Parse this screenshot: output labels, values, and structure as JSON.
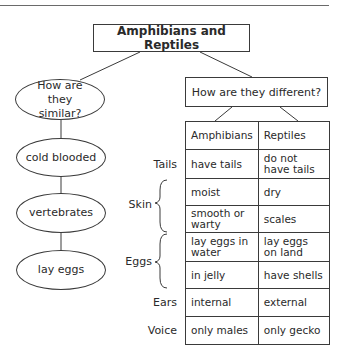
{
  "title": "Amphibians and Reptiles",
  "similar": {
    "question": "How are they similar?",
    "items": [
      "cold blooded",
      "vertebrates",
      "lay eggs"
    ]
  },
  "different": {
    "question": "How are they different?",
    "table": {
      "headers": [
        "Amphibians",
        "Reptiles"
      ],
      "groups": [
        {
          "label": "Tails",
          "rows": [
            [
              "have tails",
              "do not have tails"
            ]
          ]
        },
        {
          "label": "Skin",
          "rows": [
            [
              "moist",
              "dry"
            ],
            [
              "smooth or warty",
              "scales"
            ]
          ]
        },
        {
          "label": "Eggs",
          "rows": [
            [
              "lay eggs in water",
              "lay eggs on land"
            ],
            [
              "in jelly",
              "have shells"
            ]
          ]
        },
        {
          "label": "Ears",
          "rows": [
            [
              "internal",
              "external"
            ]
          ]
        },
        {
          "label": "Voice",
          "rows": [
            [
              "only males",
              "only gecko"
            ]
          ]
        }
      ]
    }
  }
}
